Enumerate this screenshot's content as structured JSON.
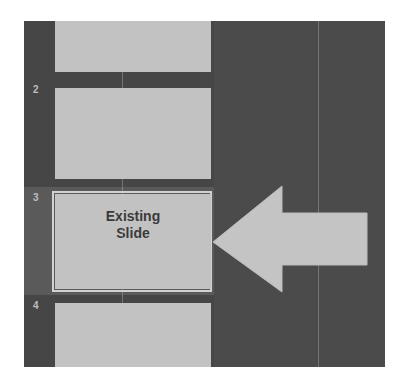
{
  "slide_panel": {
    "slides": [
      {
        "number": "",
        "title": ""
      },
      {
        "number": "2",
        "title": ""
      },
      {
        "number": "3",
        "title": "Existing\nSlide",
        "selected": true
      },
      {
        "number": "4",
        "title": ""
      }
    ]
  },
  "annotation": {
    "arrow": "left-arrow",
    "arrow_color": "#c4c4c4",
    "points_to": "3"
  },
  "colors": {
    "panel_bg": "#464646",
    "slide_fill": "#c2c2c2",
    "selection_border": "#d2d2d2",
    "title_text": "#3a3a3a"
  }
}
